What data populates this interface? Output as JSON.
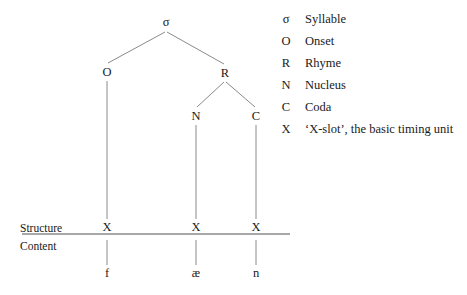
{
  "diagram": {
    "line_color": "#8a8a8a",
    "text_color": "#1a1a1a",
    "background": "#ffffff",
    "tree_nodes": [
      {
        "id": "sigma",
        "label": "σ",
        "x": 166,
        "y": 22
      },
      {
        "id": "onset",
        "label": "O",
        "x": 107,
        "y": 72
      },
      {
        "id": "rhyme",
        "label": "R",
        "x": 225,
        "y": 73
      },
      {
        "id": "nucleus",
        "label": "N",
        "x": 196,
        "y": 116
      },
      {
        "id": "coda",
        "label": "C",
        "x": 256,
        "y": 116
      },
      {
        "id": "xslot1",
        "label": "X",
        "x": 107,
        "y": 227
      },
      {
        "id": "xslot2",
        "label": "X",
        "x": 196,
        "y": 227
      },
      {
        "id": "xslot3",
        "label": "X",
        "x": 256,
        "y": 227
      }
    ],
    "segments": [
      {
        "id": "seg-f",
        "label": "f",
        "x": 107,
        "y": 273
      },
      {
        "id": "seg-ae",
        "label": "æ",
        "x": 196,
        "y": 273
      },
      {
        "id": "seg-n",
        "label": "n",
        "x": 256,
        "y": 273
      }
    ],
    "tiers": {
      "structure_label": "Structure",
      "content_label": "Content",
      "structure_label_x": 20,
      "structure_label_y": 223,
      "content_label_x": 20,
      "content_label_y": 241,
      "divider_x1": 22,
      "divider_x2": 290,
      "divider_y": 234
    }
  },
  "legend": {
    "items": [
      {
        "symbol": "σ",
        "description": "Syllable"
      },
      {
        "symbol": "O",
        "description": "Onset"
      },
      {
        "symbol": "R",
        "description": "Rhyme"
      },
      {
        "symbol": "N",
        "description": "Nucleus"
      },
      {
        "symbol": "C",
        "description": "Coda"
      },
      {
        "symbol": "X",
        "description": "‘X-slot’, the basic timing unit"
      }
    ]
  }
}
